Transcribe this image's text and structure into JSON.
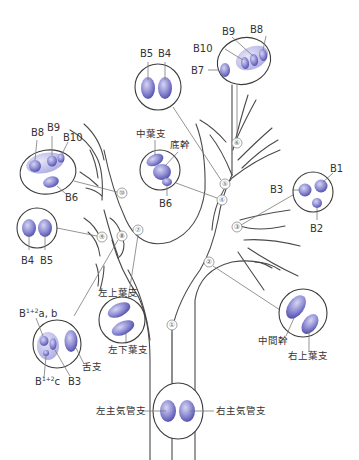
{
  "colors": {
    "bronchus_fill_light": "#c9c8ec",
    "bronchus_fill_dark": "#5a58b0",
    "segment_fill": "#8d8bd2",
    "outline": "#3c3c3c",
    "leader": "#7a7a7a"
  },
  "markers": [
    "①",
    "②",
    "③",
    "④",
    "⑤",
    "⑥",
    "⑦",
    "⑧",
    "⑨",
    "⑩"
  ],
  "sections": {
    "s1": {
      "marker": "①",
      "left": "左主気管支",
      "right": "右主気管支"
    },
    "s2": {
      "marker": "②",
      "a": "中間幹",
      "b": "右上葉支"
    },
    "s3": {
      "marker": "③",
      "b1": "B1",
      "b2": "B2",
      "b3": "B3"
    },
    "s4": {
      "marker": "④",
      "a": "中葉支",
      "b": "底幹",
      "c": "B6"
    },
    "s5": {
      "marker": "⑤",
      "a": "B5",
      "b": "B4"
    },
    "s6": {
      "marker": "⑥",
      "b7": "B7",
      "b8": "B8",
      "b9": "B9",
      "b10": "B10"
    },
    "s7": {
      "marker": "⑦",
      "a": "左上葉支",
      "b": "左下葉支"
    },
    "s8": {
      "marker": "⑧",
      "ab_base": "B",
      "ab_sup": "1+2",
      "ab_tail": "a, b",
      "c_base": "B",
      "c_sup": "1+2",
      "c_tail": "c",
      "b3": "B3",
      "lingula": "舌支"
    },
    "s9": {
      "marker": "⑨",
      "a": "B4",
      "b": "B5"
    },
    "s10": {
      "marker": "⑩",
      "b6": "B6",
      "b8": "B8",
      "b9": "B9",
      "b10": "B10"
    }
  }
}
